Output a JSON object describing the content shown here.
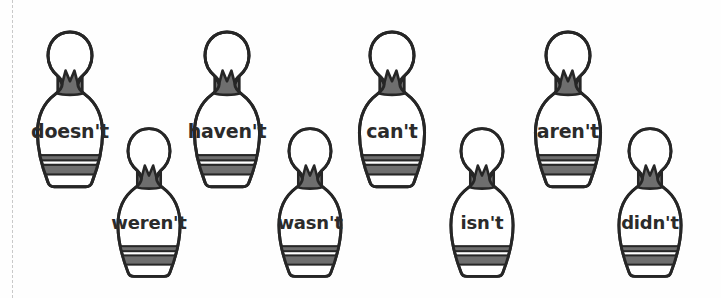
{
  "worksheet": {
    "background_color": "#fefefe",
    "width": 721,
    "height": 298,
    "cut_line": {
      "name": "dashed-cut-line",
      "x": 12,
      "color": "#c9c9c9",
      "style": "dashed"
    },
    "style": {
      "outline_color": "#262626",
      "crown_fill": "#6e6e6e",
      "stripe_fill": "#6e6e6e",
      "body_fill": "#ffffff",
      "text_color": "#2b2b2b"
    }
  },
  "pins": [
    {
      "word": "doesn't",
      "row": "top",
      "x": 26,
      "y": 28,
      "width": 88,
      "height": 168,
      "font_size": 19
    },
    {
      "word": "weren't",
      "row": "bottom",
      "x": 107,
      "y": 124,
      "width": 84,
      "height": 162,
      "font_size": 18
    },
    {
      "word": "haven't",
      "row": "top",
      "x": 183,
      "y": 28,
      "width": 88,
      "height": 168,
      "font_size": 19
    },
    {
      "word": "wasn't",
      "row": "bottom",
      "x": 268,
      "y": 124,
      "width": 84,
      "height": 162,
      "font_size": 18
    },
    {
      "word": "can't",
      "row": "top",
      "x": 348,
      "y": 28,
      "width": 88,
      "height": 168,
      "font_size": 19
    },
    {
      "word": "isn't",
      "row": "bottom",
      "x": 440,
      "y": 124,
      "width": 84,
      "height": 162,
      "font_size": 18
    },
    {
      "word": "aren't",
      "row": "top",
      "x": 524,
      "y": 28,
      "width": 88,
      "height": 168,
      "font_size": 19
    },
    {
      "word": "didn't",
      "row": "bottom",
      "x": 608,
      "y": 124,
      "width": 84,
      "height": 162,
      "font_size": 18
    }
  ]
}
